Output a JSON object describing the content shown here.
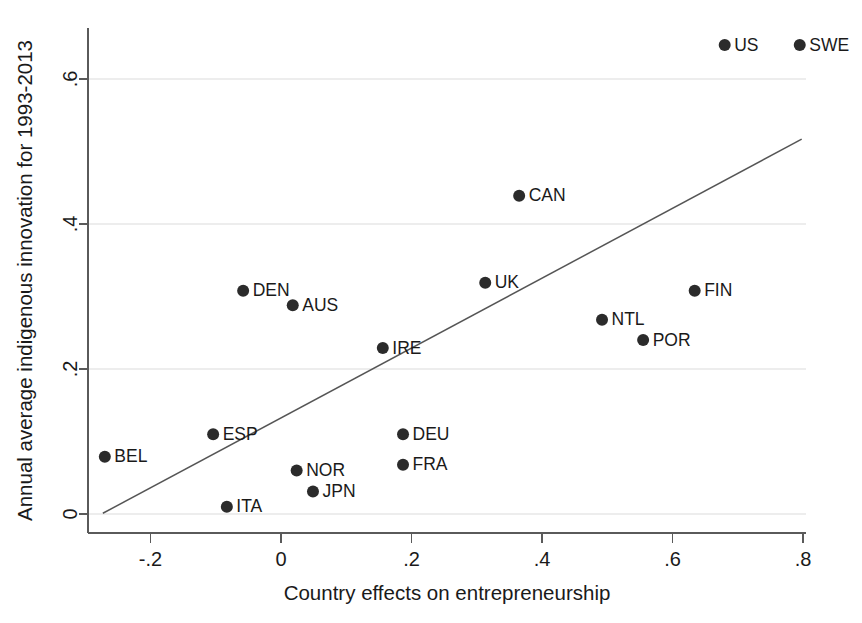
{
  "chart_data": {
    "type": "scatter",
    "title": "",
    "xlabel": "Country effects on entrepreneurship",
    "ylabel": "Annual average indigenous innovation for 1993-2013",
    "xlim": [
      -0.29,
      0.83
    ],
    "ylim": [
      -0.012,
      0.7
    ],
    "xticks": [
      -0.2,
      0,
      0.2,
      0.4,
      0.6,
      0.8
    ],
    "xticklabels": [
      "-.2",
      "0",
      ".2",
      ".4",
      ".6",
      ".8"
    ],
    "yticks": [
      0,
      0.2,
      0.4,
      0.6
    ],
    "yticklabels": [
      "0",
      ".2",
      ".4",
      ".6"
    ],
    "grid": "horizontal-only",
    "legend": "none",
    "points": [
      {
        "label": "US",
        "x": 0.68,
        "y": 0.647,
        "label_side": "right"
      },
      {
        "label": "SWE",
        "x": 0.795,
        "y": 0.647,
        "label_side": "right"
      },
      {
        "label": "CAN",
        "x": 0.365,
        "y": 0.439,
        "label_side": "right"
      },
      {
        "label": "UK",
        "x": 0.313,
        "y": 0.319,
        "label_side": "right"
      },
      {
        "label": "FIN",
        "x": 0.634,
        "y": 0.308,
        "label_side": "right"
      },
      {
        "label": "DEN",
        "x": -0.058,
        "y": 0.308,
        "label_side": "right"
      },
      {
        "label": "AUS",
        "x": 0.018,
        "y": 0.288,
        "label_side": "right"
      },
      {
        "label": "NTL",
        "x": 0.492,
        "y": 0.268,
        "label_side": "right"
      },
      {
        "label": "POR",
        "x": 0.555,
        "y": 0.24,
        "label_side": "right"
      },
      {
        "label": "IRE",
        "x": 0.156,
        "y": 0.229,
        "label_side": "right"
      },
      {
        "label": "DEU",
        "x": 0.187,
        "y": 0.11,
        "label_side": "right"
      },
      {
        "label": "ESP",
        "x": -0.104,
        "y": 0.11,
        "label_side": "right"
      },
      {
        "label": "BEL",
        "x": -0.27,
        "y": 0.079,
        "label_side": "right"
      },
      {
        "label": "FRA",
        "x": 0.187,
        "y": 0.068,
        "label_side": "right"
      },
      {
        "label": "NOR",
        "x": 0.024,
        "y": 0.06,
        "label_side": "right"
      },
      {
        "label": "JPN",
        "x": 0.049,
        "y": 0.031,
        "label_side": "right"
      },
      {
        "label": "ITA",
        "x": -0.083,
        "y": 0.01,
        "label_side": "right"
      }
    ],
    "fit_line": {
      "name": "linear fit",
      "x_start": -0.273,
      "y_start": 0.001,
      "x_end": 0.798,
      "y_end": 0.517
    }
  },
  "style": {
    "marker_color": "#2b2b2b",
    "line_color": "#555555",
    "axis_color": "#5a5a5a",
    "grid_color": "#ededed",
    "text_color": "#1a1a1a",
    "background": "#ffffff",
    "marker_radius": 6.0
  }
}
